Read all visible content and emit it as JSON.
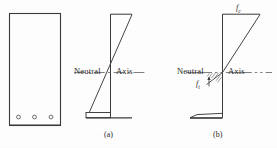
{
  "figure": {
    "background_color": "#ffffff",
    "line_color": "#3a3a3a",
    "text_color": "#2b2b2b"
  },
  "cross_section": {
    "name": "beam-cross-section",
    "shape": "rectangle",
    "rebar_count": 3,
    "rebar_label": "reinforcing-bar"
  },
  "diagram_a": {
    "caption": "(a)",
    "neutral_label": "Neutral",
    "axis_label": "Axis",
    "description": "uncracked section stress distribution"
  },
  "diagram_b": {
    "caption": "(b)",
    "neutral_label": "Neutral",
    "axis_label": "Axis",
    "compression_stress": "f",
    "compression_stress_sub": "c",
    "tension_stress": "f",
    "tension_stress_sub": "t",
    "description": "cracked section stress distribution with hatched tension zone"
  }
}
